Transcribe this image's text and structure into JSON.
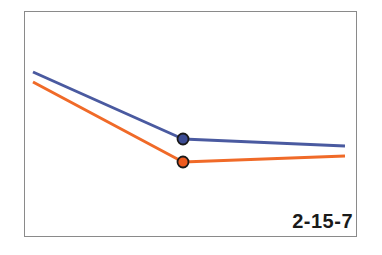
{
  "figure": {
    "label": "2-15-7",
    "frame_color": "#8a8a8a",
    "background": "#ffffff"
  },
  "chart_data": {
    "type": "line",
    "title": "",
    "xlabel": "",
    "ylabel": "",
    "grid": false,
    "legend": null,
    "annotation": "2-15-7",
    "x": [
      0,
      1,
      2
    ],
    "series": [
      {
        "name": "upper line",
        "color": "#4a5aa0",
        "values": [
          72,
          139,
          146
        ],
        "pixel_points": [
          [
            33,
            72
          ],
          [
            183,
            139
          ],
          [
            345,
            146
          ]
        ],
        "marker_index": 1,
        "marker_fill": "#3c4c94"
      },
      {
        "name": "lower line",
        "color": "#f06a28",
        "values": [
          82,
          162,
          156
        ],
        "pixel_points": [
          [
            33,
            82
          ],
          [
            183,
            162
          ],
          [
            345,
            156
          ]
        ],
        "marker_index": 1,
        "marker_fill": "#ee5a1e"
      }
    ],
    "note": "values given as pixel y-coordinates (lower = higher on screen); no axes or tick labels shown"
  }
}
